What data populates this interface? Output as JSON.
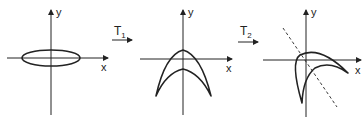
{
  "panels": [
    {
      "name": "original",
      "x_label": "x",
      "y_label": "y",
      "shape": "ellipse"
    },
    {
      "name": "after-T1",
      "x_label": "x",
      "y_label": "y",
      "shape": "crescent-arch"
    },
    {
      "name": "after-T2",
      "x_label": "x",
      "y_label": "y",
      "shape": "rotated-crescent",
      "has_dashed_axis": true
    }
  ],
  "transforms": [
    {
      "label": "T",
      "subscript": "1"
    },
    {
      "label": "T",
      "subscript": "2"
    }
  ],
  "colors": {
    "stroke": "#222222",
    "background": "#ffffff"
  }
}
